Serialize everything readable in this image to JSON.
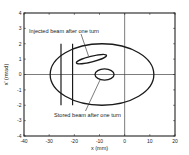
{
  "chart_data": {
    "type": "line",
    "title": "",
    "xlabel": "x (mm)",
    "ylabel": "x' (mrad)",
    "xlim": [
      -40,
      20
    ],
    "ylim": [
      -4,
      4
    ],
    "xticks": [
      -40,
      -30,
      -20,
      -10,
      0,
      10,
      20
    ],
    "yticks": [
      -4,
      -3,
      -2,
      -1,
      0,
      1,
      2,
      3,
      4
    ],
    "grid": false,
    "legend": null,
    "axes_lines": {
      "x_zero": true,
      "y_zero": true
    },
    "series": [
      {
        "name": "Acceptance ellipse",
        "shape": "ellipse",
        "center": [
          -9,
          0
        ],
        "semi_axes": [
          20.6,
          2.0
        ],
        "angle_deg": 0
      },
      {
        "name": "Injected beam after one turn",
        "shape": "ellipse",
        "center": [
          -13.2,
          1.0
        ],
        "semi_axes": [
          6.2,
          0.2
        ],
        "angle_deg": -14
      },
      {
        "name": "Stored beam after one turn",
        "shape": "ellipse",
        "center": [
          -8.0,
          0.0
        ],
        "semi_axes": [
          3.8,
          0.36
        ],
        "angle_deg": 0
      },
      {
        "name": "Septum wall 1",
        "shape": "vline",
        "x": -25.3,
        "y_range": [
          -2,
          2
        ]
      },
      {
        "name": "Septum wall 2",
        "shape": "vline",
        "x": -20.7,
        "y_range": [
          -2,
          2
        ]
      }
    ],
    "annotations": [
      {
        "text": "Injected beam after one turn",
        "target": "Injected beam after one turn"
      },
      {
        "text": "Stored beam after one turn",
        "target": "Stored beam after one turn"
      }
    ]
  },
  "labels": {
    "xlabel": "x (mm)",
    "ylabel": "x' (mrad)",
    "injected": "Injected beam after one turn",
    "stored": "Stored beam after one turn"
  }
}
